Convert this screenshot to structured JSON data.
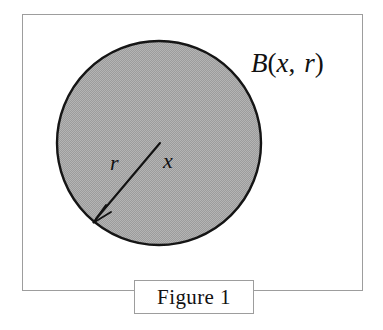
{
  "figure": {
    "caption": "Figure 1",
    "frame": {
      "border_color": "#9d9d9d"
    },
    "ball": {
      "name": "closed ball",
      "fill_color": "#a9a9a9",
      "stroke_color": "#151515",
      "center_label": "x",
      "radius_label": "r",
      "set_label": {
        "name": "B",
        "open_paren": "(",
        "arg1": "x",
        "comma": ",",
        "arg2": "r",
        "close_paren": ")",
        "full": "B(x, r)"
      }
    }
  }
}
